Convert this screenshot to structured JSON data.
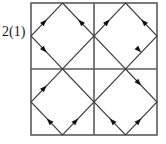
{
  "figure": {
    "label": "2(1)",
    "type": "directed-graph-diagram",
    "colors": {
      "background": "#ffffff",
      "outer_square_stroke": "#5a5a5a",
      "divider_stroke": "#5a5a5a",
      "diamond_stroke": "#3c3c3c",
      "arrow_fill": "#111111",
      "label_text": "#1a1a1a"
    },
    "geometry": {
      "square": {
        "x": 31,
        "y": 3,
        "width": 126,
        "height": 132
      },
      "center": {
        "x": 94,
        "y": 69
      },
      "quadrants": [
        {
          "name": "top-left",
          "x": 31,
          "y": 3,
          "width": 63,
          "height": 66
        },
        {
          "name": "top-right",
          "x": 94,
          "y": 3,
          "width": 63,
          "height": 66
        },
        {
          "name": "bottom-left",
          "x": 31,
          "y": 69,
          "width": 63,
          "height": 66
        },
        {
          "name": "bottom-right",
          "x": 94,
          "y": 69,
          "width": 63,
          "height": 66
        }
      ]
    },
    "diamonds": [
      {
        "name": "diamond-top-left",
        "vertices": {
          "top": [
            62.5,
            3
          ],
          "right": [
            94,
            36
          ],
          "bottom": [
            62.5,
            69
          ],
          "left": [
            31,
            36
          ]
        },
        "edges": [
          {
            "name": "edge-left-to-top",
            "from": "left",
            "to": "top",
            "arrow_at": 0.5,
            "direction": "up-right"
          },
          {
            "name": "edge-right-to-top",
            "from": "right",
            "to": "top",
            "arrow_at": 0.5,
            "direction": "up-left"
          },
          {
            "name": "edge-left-to-bottom",
            "from": "left",
            "to": "bottom",
            "arrow_at": 0.5,
            "direction": "down-right"
          }
        ]
      },
      {
        "name": "diamond-top-right",
        "vertices": {
          "top": [
            125.5,
            3
          ],
          "right": [
            157,
            36
          ],
          "bottom": [
            125.5,
            69
          ],
          "left": [
            94,
            36
          ]
        },
        "edges": [
          {
            "name": "edge-left-to-top",
            "from": "left",
            "to": "top",
            "arrow_at": 0.5,
            "direction": "up-right"
          },
          {
            "name": "edge-right-to-top",
            "from": "right",
            "to": "top",
            "arrow_at": 0.5,
            "direction": "up-left"
          },
          {
            "name": "edge-right-down",
            "from": "right",
            "to": "bottom",
            "arrow_at": 0.5,
            "direction": "down-right"
          }
        ]
      },
      {
        "name": "diamond-bottom-left",
        "vertices": {
          "top": [
            62.5,
            69
          ],
          "right": [
            94,
            102
          ],
          "bottom": [
            62.5,
            135
          ],
          "left": [
            31,
            102
          ]
        },
        "edges": [
          {
            "name": "edge-left-to-top",
            "from": "left",
            "to": "top",
            "arrow_at": 0.5,
            "direction": "up-right"
          },
          {
            "name": "edge-bottom-to-left",
            "from": "bottom",
            "to": "left",
            "arrow_at": 0.5,
            "direction": "up-left"
          },
          {
            "name": "edge-bottom-to-right",
            "from": "bottom",
            "to": "right",
            "arrow_at": 0.5,
            "direction": "up-right"
          }
        ]
      },
      {
        "name": "diamond-bottom-right",
        "vertices": {
          "top": [
            125.5,
            69
          ],
          "right": [
            157,
            102
          ],
          "bottom": [
            125.5,
            135
          ],
          "left": [
            94,
            102
          ]
        },
        "edges": [
          {
            "name": "edge-top-to-right",
            "from": "top",
            "to": "right",
            "arrow_at": 0.5,
            "direction": "down-right"
          },
          {
            "name": "edge-bottom-to-left",
            "from": "bottom",
            "to": "left",
            "arrow_at": 0.5,
            "direction": "up-left"
          },
          {
            "name": "edge-bottom-to-right",
            "from": "bottom",
            "to": "right",
            "arrow_at": 0.5,
            "direction": "up-right"
          }
        ]
      }
    ]
  }
}
